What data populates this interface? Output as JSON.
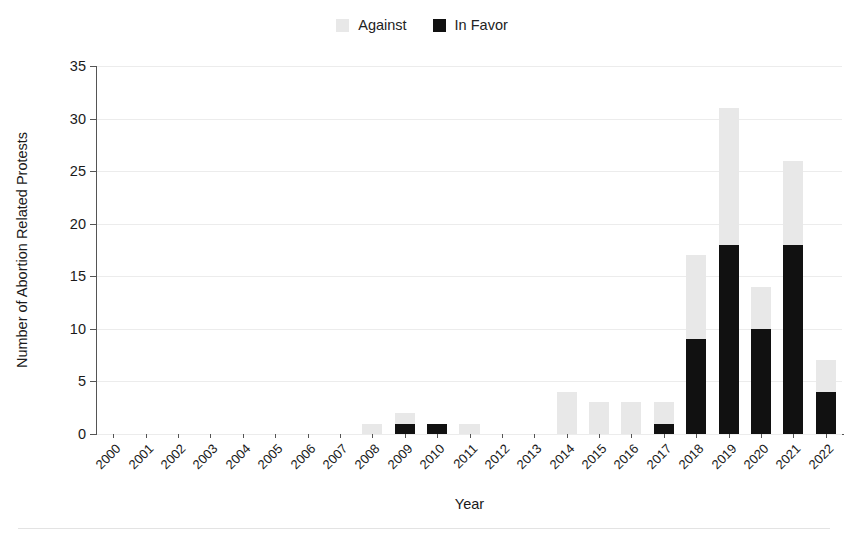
{
  "legend": {
    "position": "top-center",
    "items": [
      {
        "label": "Against",
        "color": "#e8e8e8",
        "name": "legend-swatch-against"
      },
      {
        "label": "In Favor",
        "color": "#111111",
        "name": "legend-swatch-in-favor"
      }
    ]
  },
  "axes": {
    "ylabel": "Number of Abortion Related Protests",
    "xlabel": "Year",
    "yticks": [
      "0",
      "5",
      "10",
      "15",
      "20",
      "25",
      "30",
      "35"
    ]
  },
  "chart_data": {
    "type": "bar",
    "subtype": "stacked",
    "title": "",
    "xlabel": "Year",
    "ylabel": "Number of Abortion Related Protests",
    "ylim": [
      0,
      35
    ],
    "ytick_step": 5,
    "grid": true,
    "legend_position": "top-center",
    "categories": [
      "2000",
      "2001",
      "2002",
      "2003",
      "2004",
      "2005",
      "2006",
      "2007",
      "2008",
      "2009",
      "2010",
      "2011",
      "2012",
      "2013",
      "2014",
      "2015",
      "2016",
      "2017",
      "2018",
      "2019",
      "2020",
      "2021",
      "2022"
    ],
    "series": [
      {
        "name": "In Favor",
        "color": "#111111",
        "values": [
          0,
          0,
          0,
          0,
          0,
          0,
          0,
          0,
          0,
          1,
          1,
          0,
          0,
          0,
          0,
          0,
          0,
          1,
          9,
          18,
          10,
          18,
          4
        ]
      },
      {
        "name": "Against",
        "color": "#e8e8e8",
        "values": [
          0,
          0,
          0,
          0,
          0,
          0,
          0,
          0,
          1,
          1,
          0,
          1,
          0,
          0,
          4,
          3,
          3,
          2,
          8,
          13,
          4,
          8,
          3
        ]
      }
    ],
    "totals": [
      0,
      0,
      0,
      0,
      0,
      0,
      0,
      0,
      1,
      2,
      1,
      1,
      0,
      0,
      4,
      3,
      3,
      3,
      17,
      31,
      14,
      26,
      7
    ]
  }
}
